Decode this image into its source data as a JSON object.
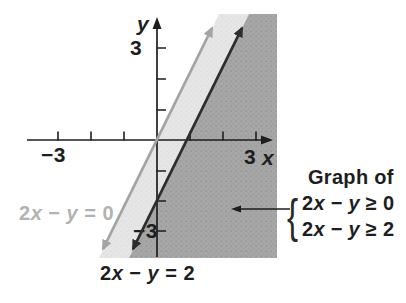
{
  "labels": {
    "y_axis": "y",
    "x_axis": "x",
    "y_max": "3",
    "y_min": "−3",
    "x_max": "3",
    "x_min": "−3",
    "gray_line": "2x − y = 0",
    "black_line": "2x − y = 2"
  },
  "legend": {
    "title": "Graph of",
    "brace": "{",
    "line1": "2x − y ≥ 0",
    "line2": "2x − y ≥ 2"
  },
  "colors": {
    "axis": "#1e1e1e",
    "black_line": "#2d2d2d",
    "gray_line": "#a4a4a4",
    "gray_label_text": "#b2b2b2",
    "light_region": "#e4e4e4",
    "dark_region": "#a5a5a5"
  },
  "chart_data": {
    "type": "line",
    "title": "",
    "xlabel": "x",
    "ylabel": "y",
    "xlim": [
      -4,
      3.6
    ],
    "ylim": [
      -3.9,
      3.9
    ],
    "x_ticks": [
      -3,
      -2,
      -1,
      1,
      2,
      3
    ],
    "y_ticks": [
      -3,
      -2,
      -1,
      1,
      2,
      3
    ],
    "tick_labels_shown": {
      "x": [
        "-3",
        "3"
      ],
      "y": [
        "-3",
        "3"
      ]
    },
    "grid": false,
    "series": [
      {
        "name": "2x − y = 0",
        "equation": "y = 2x",
        "color": "#a4a4a4",
        "style": "solid, arrows both ends",
        "points": [
          [
            -1.7,
            -3.4
          ],
          [
            1.75,
            3.5
          ]
        ],
        "x_intercept": 0,
        "y_intercept": 0
      },
      {
        "name": "2x − y = 2",
        "equation": "y = 2x − 2",
        "color": "#2d2d2d",
        "style": "solid, arrows both ends",
        "points": [
          [
            -0.8,
            -3.6
          ],
          [
            2.65,
            3.3
          ]
        ],
        "x_intercept": 1,
        "y_intercept": -2
      }
    ],
    "shaded_regions": [
      {
        "label": "2x − y ≥ 0",
        "bounds": "band between line 2x − y = 0 and line 2x − y = 2",
        "color": "#e4e4e4"
      },
      {
        "label": "2x − y ≥ 2 (solution of system)",
        "bounds": "half-plane right of line 2x − y = 2",
        "color": "#a5a5a5"
      }
    ],
    "legend": {
      "position": "right",
      "title": "Graph of",
      "entries": [
        "2x − y ≥ 0",
        "2x − y ≥ 2"
      ],
      "arrow_points_to": "dark shaded solution region"
    }
  }
}
